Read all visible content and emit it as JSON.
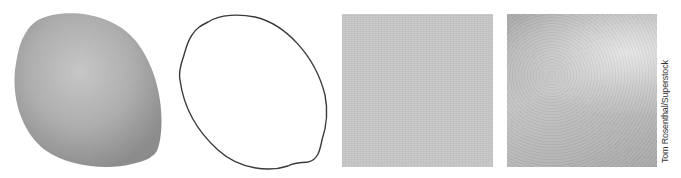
{
  "figure": {
    "panels": [
      {
        "id": "lemon-photo",
        "description": "Grayscale photograph of a lemon",
        "fill_color": "#a9a9a9",
        "highlight_color": "#c8c8c8"
      },
      {
        "id": "lemon-outline",
        "description": "Line drawing outline of lemon shape",
        "stroke_color": "#333333"
      },
      {
        "id": "texture-smooth",
        "description": "Uniform gray texture square",
        "fill_color": "#c6c6c6"
      },
      {
        "id": "texture-rough",
        "description": "Gradient peel texture square",
        "fill_color": "#b8b8b8"
      }
    ],
    "credit": "Tom Rosenthal/Superstock"
  }
}
